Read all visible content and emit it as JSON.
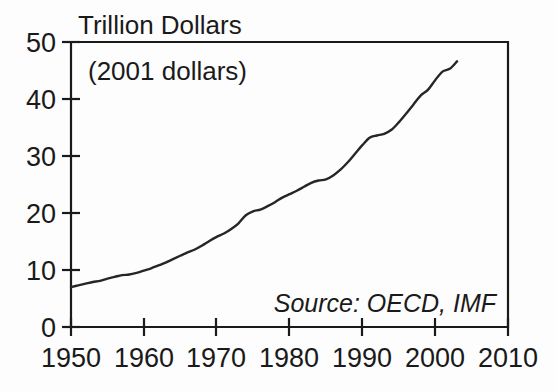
{
  "chart_data": {
    "type": "line",
    "title": "Trillion Dollars",
    "subtitle": "(2001 dollars)",
    "annotation": "Source: OECD, IMF",
    "xlabel": "",
    "ylabel": "Trillion Dollars",
    "xlim": [
      1950,
      2010
    ],
    "ylim": [
      0,
      50
    ],
    "grid": false,
    "legend": false,
    "x_ticks": [
      "1950",
      "1960",
      "1970",
      "1980",
      "1990",
      "2000",
      "2010"
    ],
    "y_ticks": [
      "0",
      "10",
      "20",
      "30",
      "40",
      "50"
    ],
    "x_tick_values": [
      1950,
      1960,
      1970,
      1980,
      1990,
      2000,
      2010
    ],
    "y_tick_values": [
      0,
      10,
      20,
      30,
      40,
      50
    ],
    "line_color": "#262626",
    "series": [
      {
        "name": "World GDP",
        "x": [
          1950,
          1951,
          1952,
          1953,
          1954,
          1955,
          1956,
          1957,
          1958,
          1959,
          1960,
          1961,
          1962,
          1963,
          1964,
          1965,
          1966,
          1967,
          1968,
          1969,
          1970,
          1971,
          1972,
          1973,
          1974,
          1975,
          1976,
          1977,
          1978,
          1979,
          1980,
          1981,
          1982,
          1983,
          1984,
          1985,
          1986,
          1987,
          1988,
          1989,
          1990,
          1991,
          1992,
          1993,
          1994,
          1995,
          1996,
          1997,
          1998,
          1999,
          2000,
          2001,
          2002,
          2003
        ],
        "values": [
          7.0,
          7.3,
          7.6,
          7.9,
          8.1,
          8.5,
          8.8,
          9.1,
          9.2,
          9.5,
          9.9,
          10.3,
          10.8,
          11.3,
          11.9,
          12.5,
          13.1,
          13.6,
          14.3,
          15.1,
          15.8,
          16.4,
          17.2,
          18.2,
          19.6,
          20.3,
          20.6,
          21.2,
          21.9,
          22.7,
          23.3,
          23.9,
          24.6,
          25.3,
          25.7,
          25.9,
          26.6,
          27.6,
          28.9,
          30.4,
          31.9,
          33.2,
          33.6,
          33.9,
          34.6,
          35.9,
          37.4,
          39.0,
          40.6,
          41.6,
          43.3,
          44.8,
          45.3,
          46.6
        ]
      }
    ]
  }
}
